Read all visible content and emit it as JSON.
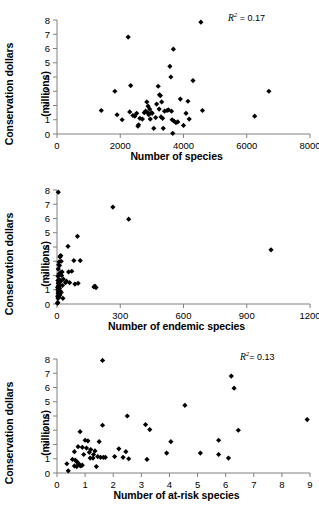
{
  "figure": {
    "panel_count": 3,
    "marker_color": "#000000",
    "axis_color": "#808080",
    "background": "#ffffff"
  },
  "chart_data": [
    {
      "type": "scatter",
      "title": "",
      "xlabel": "Number of species",
      "ylabel": "Conservation dollars (millions)",
      "ylabel_line1": "Conservation dollars",
      "ylabel_line2": "(millions)",
      "annotation": "R2 = 0.17",
      "annotation_r2_value": "0.17",
      "annotation_prefix": "R",
      "annotation_sup": "2",
      "annotation_eq": "= ",
      "xlim": [
        0,
        8000
      ],
      "ylim": [
        0,
        8
      ],
      "xticks": [
        0,
        2000,
        4000,
        6000,
        8000
      ],
      "xtick_labels": [
        "0",
        "2000",
        "4000",
        "6000",
        "8000"
      ],
      "yticks": [
        0,
        1,
        2,
        3,
        4,
        5,
        6,
        7,
        8
      ],
      "ytick_labels": [
        "0",
        "1",
        "2",
        "3",
        "4",
        "5",
        "6",
        "7",
        "8"
      ],
      "grid": false,
      "legend": "none",
      "points": [
        [
          1400,
          1.65
        ],
        [
          1830,
          3.0
        ],
        [
          1900,
          1.35
        ],
        [
          2060,
          1.0
        ],
        [
          2250,
          6.8
        ],
        [
          2330,
          3.4
        ],
        [
          2300,
          1.55
        ],
        [
          2400,
          1.3
        ],
        [
          2460,
          1.25
        ],
        [
          2520,
          1.45
        ],
        [
          2560,
          0.55
        ],
        [
          2580,
          0.65
        ],
        [
          2620,
          1.1
        ],
        [
          2700,
          1.05
        ],
        [
          2760,
          1.5
        ],
        [
          2800,
          1.6
        ],
        [
          2840,
          2.25
        ],
        [
          2870,
          1.5
        ],
        [
          2880,
          1.95
        ],
        [
          2900,
          1.35
        ],
        [
          2930,
          1.75
        ],
        [
          2950,
          1.05
        ],
        [
          2990,
          1.5
        ],
        [
          3010,
          1.45
        ],
        [
          3060,
          0.4
        ],
        [
          3120,
          1.15
        ],
        [
          3150,
          2.1
        ],
        [
          3200,
          3.35
        ],
        [
          3230,
          1.75
        ],
        [
          3240,
          2.75
        ],
        [
          3270,
          2.7
        ],
        [
          3290,
          1.2
        ],
        [
          3310,
          2.25
        ],
        [
          3340,
          1.1
        ],
        [
          3360,
          0.4
        ],
        [
          3400,
          1.6
        ],
        [
          3480,
          1.65
        ],
        [
          3520,
          1.7
        ],
        [
          3570,
          4.75
        ],
        [
          3600,
          4.0
        ],
        [
          3620,
          1.6
        ],
        [
          3640,
          1.0
        ],
        [
          3660,
          0.05
        ],
        [
          3680,
          5.95
        ],
        [
          3700,
          0.9
        ],
        [
          3760,
          0.8
        ],
        [
          3820,
          0.85
        ],
        [
          3900,
          2.45
        ],
        [
          4000,
          0.6
        ],
        [
          4080,
          1.45
        ],
        [
          4140,
          2.3
        ],
        [
          4180,
          1.05
        ],
        [
          4300,
          3.75
        ],
        [
          4550,
          7.85
        ],
        [
          4600,
          1.65
        ],
        [
          6250,
          1.25
        ],
        [
          6700,
          3.0
        ]
      ]
    },
    {
      "type": "scatter",
      "title": "",
      "xlabel": "Number of endemic species",
      "ylabel": "Conservation dollars (millions)",
      "ylabel_line1": "Conservation dollars",
      "ylabel_line2": "(millions)",
      "annotation": "R2 = 0.13",
      "annotation_r2_value": "0.13",
      "annotation_prefix": "R",
      "annotation_sup": "2",
      "annotation_eq": "= ",
      "xlim": [
        0,
        1200
      ],
      "ylim": [
        0,
        8
      ],
      "xticks": [
        0,
        300,
        600,
        900,
        1200
      ],
      "xtick_labels": [
        "0",
        "300",
        "600",
        "900",
        "1200"
      ],
      "yticks": [
        0,
        1,
        2,
        3,
        4,
        5,
        6,
        7,
        8
      ],
      "ytick_labels": [
        "0",
        "1",
        "2",
        "3",
        "4",
        "5",
        "6",
        "7",
        "8"
      ],
      "grid": false,
      "legend": "none",
      "points": [
        [
          6,
          7.85
        ],
        [
          265,
          6.8
        ],
        [
          340,
          5.95
        ],
        [
          1015,
          3.8
        ],
        [
          97,
          4.75
        ],
        [
          52,
          4.05
        ],
        [
          80,
          3.05
        ],
        [
          110,
          3.05
        ],
        [
          18,
          3.4
        ],
        [
          15,
          3.35
        ],
        [
          14,
          3.3
        ],
        [
          20,
          3.0
        ],
        [
          10,
          2.95
        ],
        [
          8,
          2.75
        ],
        [
          12,
          2.7
        ],
        [
          6,
          2.45
        ],
        [
          55,
          2.25
        ],
        [
          70,
          2.3
        ],
        [
          24,
          2.25
        ],
        [
          16,
          2.2
        ],
        [
          9,
          2.1
        ],
        [
          5,
          1.95
        ],
        [
          22,
          2.0
        ],
        [
          30,
          1.75
        ],
        [
          12,
          1.7
        ],
        [
          7,
          1.65
        ],
        [
          4,
          1.65
        ],
        [
          45,
          1.6
        ],
        [
          60,
          1.5
        ],
        [
          100,
          1.45
        ],
        [
          85,
          1.4
        ],
        [
          18,
          1.6
        ],
        [
          11,
          1.55
        ],
        [
          9,
          1.5
        ],
        [
          6,
          1.45
        ],
        [
          14,
          1.35
        ],
        [
          26,
          1.3
        ],
        [
          5,
          1.25
        ],
        [
          8,
          1.2
        ],
        [
          3,
          1.15
        ],
        [
          175,
          1.2
        ],
        [
          180,
          1.25
        ],
        [
          185,
          1.15
        ],
        [
          12,
          1.1
        ],
        [
          7,
          1.05
        ],
        [
          4,
          1.0
        ],
        [
          10,
          0.95
        ],
        [
          16,
          0.9
        ],
        [
          6,
          0.85
        ],
        [
          20,
          0.8
        ],
        [
          5,
          0.75
        ],
        [
          9,
          0.65
        ],
        [
          13,
          0.6
        ],
        [
          3,
          0.55
        ],
        [
          7,
          0.45
        ],
        [
          28,
          0.4
        ],
        [
          5,
          0.4
        ],
        [
          4,
          0.1
        ],
        [
          2,
          0.05
        ],
        [
          40,
          1.5
        ]
      ]
    },
    {
      "type": "scatter",
      "title": "",
      "xlabel": "Number of at-risk species",
      "ylabel": "Conservation dollars (millions)",
      "ylabel_line1": "Conservation dollars",
      "ylabel_line2": "(millions)",
      "annotation": "R2 = 0.16",
      "annotation_r2_value": "0.16",
      "annotation_prefix": "R",
      "annotation_sup": "2",
      "annotation_eq": "= ",
      "xlim": [
        0,
        9
      ],
      "ylim": [
        0,
        8
      ],
      "xticks": [
        0,
        1,
        2,
        3,
        4,
        5,
        6,
        7,
        8,
        9
      ],
      "xtick_labels": [
        "0",
        "1",
        "2",
        "3",
        "4",
        "5",
        "6",
        "7",
        "8",
        "9"
      ],
      "yticks": [
        0,
        1,
        2,
        3,
        4,
        5,
        6,
        7,
        8
      ],
      "ytick_labels": [
        "0",
        "1",
        "2",
        "3",
        "4",
        "5",
        "6",
        "7",
        "8"
      ],
      "grid": false,
      "legend": "none",
      "points": [
        [
          1.62,
          7.9
        ],
        [
          6.2,
          6.8
        ],
        [
          6.3,
          5.95
        ],
        [
          4.55,
          4.75
        ],
        [
          8.9,
          3.75
        ],
        [
          2.5,
          4.0
        ],
        [
          3.15,
          3.4
        ],
        [
          3.3,
          3.05
        ],
        [
          6.45,
          3.0
        ],
        [
          1.62,
          3.35
        ],
        [
          0.82,
          2.9
        ],
        [
          1.0,
          2.3
        ],
        [
          1.1,
          2.25
        ],
        [
          1.5,
          2.2
        ],
        [
          4.05,
          2.2
        ],
        [
          5.75,
          2.3
        ],
        [
          0.75,
          1.85
        ],
        [
          0.9,
          1.8
        ],
        [
          1.05,
          1.75
        ],
        [
          1.2,
          1.65
        ],
        [
          2.2,
          1.7
        ],
        [
          2.45,
          1.5
        ],
        [
          1.35,
          1.55
        ],
        [
          0.62,
          1.5
        ],
        [
          1.3,
          1.3
        ],
        [
          1.45,
          1.15
        ],
        [
          1.55,
          1.1
        ],
        [
          1.65,
          1.1
        ],
        [
          2.05,
          1.15
        ],
        [
          2.35,
          1.1
        ],
        [
          2.55,
          1.0
        ],
        [
          3.2,
          0.95
        ],
        [
          3.9,
          1.4
        ],
        [
          5.1,
          1.4
        ],
        [
          5.75,
          1.3
        ],
        [
          6.1,
          1.05
        ],
        [
          0.55,
          0.95
        ],
        [
          0.65,
          0.9
        ],
        [
          0.7,
          0.8
        ],
        [
          0.75,
          0.7
        ],
        [
          0.78,
          0.6
        ],
        [
          0.8,
          0.55
        ],
        [
          0.85,
          0.5
        ],
        [
          0.9,
          0.55
        ],
        [
          0.7,
          0.45
        ],
        [
          0.62,
          0.5
        ],
        [
          0.35,
          0.65
        ],
        [
          0.4,
          0.15
        ],
        [
          1.4,
          0.45
        ],
        [
          1.28,
          1.05
        ],
        [
          1.18,
          1.05
        ],
        [
          1.72,
          1.1
        ],
        [
          0.95,
          1.3
        ],
        [
          1.15,
          1.45
        ]
      ]
    }
  ]
}
